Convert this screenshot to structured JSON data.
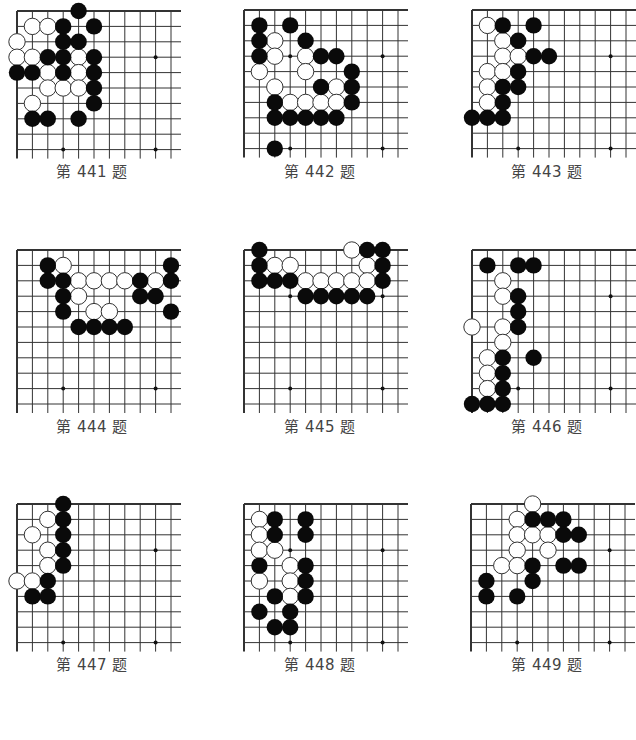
{
  "page": {
    "colors": {
      "line": "#333333",
      "black_stone": "#0a0a0a",
      "white_stone": "#ffffff",
      "stone_outline": "#333333",
      "caption": "#444444"
    },
    "grid_spacing": 15.4,
    "stone_radius": 8.2
  },
  "problems": [
    {
      "caption": "第 441 题",
      "number": 441,
      "origin": [
        17,
        11
      ],
      "cols": 11,
      "rows": 10,
      "caption_xy": [
        12,
        160
      ],
      "star_points": [
        [
          3,
          3
        ],
        [
          9,
          3
        ],
        [
          3,
          9
        ],
        [
          9,
          9
        ]
      ],
      "black": [
        [
          4,
          0
        ],
        [
          3,
          1
        ],
        [
          5,
          1
        ],
        [
          3,
          2
        ],
        [
          4,
          2
        ],
        [
          2,
          3
        ],
        [
          3,
          3
        ],
        [
          5,
          3
        ],
        [
          0,
          4
        ],
        [
          1,
          4
        ],
        [
          3,
          4
        ],
        [
          5,
          4
        ],
        [
          5,
          5
        ],
        [
          5,
          6
        ],
        [
          1,
          7
        ],
        [
          2,
          7
        ],
        [
          4,
          7
        ]
      ],
      "white": [
        [
          1,
          1
        ],
        [
          2,
          1
        ],
        [
          0,
          2
        ],
        [
          0,
          3
        ],
        [
          1,
          3
        ],
        [
          4,
          3
        ],
        [
          2,
          4
        ],
        [
          4,
          4
        ],
        [
          2,
          5
        ],
        [
          3,
          5
        ],
        [
          4,
          5
        ],
        [
          1,
          6
        ]
      ]
    },
    {
      "caption": "第 442 题",
      "number": 442,
      "origin": [
        244,
        10
      ],
      "cols": 11,
      "rows": 10,
      "caption_xy": [
        240,
        160
      ],
      "star_points": [
        [
          3,
          3
        ],
        [
          9,
          3
        ],
        [
          3,
          9
        ],
        [
          9,
          9
        ]
      ],
      "black": [
        [
          1,
          1
        ],
        [
          3,
          1
        ],
        [
          1,
          2
        ],
        [
          4,
          2
        ],
        [
          1,
          3
        ],
        [
          5,
          3
        ],
        [
          6,
          3
        ],
        [
          7,
          4
        ],
        [
          5,
          5
        ],
        [
          7,
          5
        ],
        [
          2,
          6
        ],
        [
          7,
          6
        ],
        [
          2,
          7
        ],
        [
          3,
          7
        ],
        [
          4,
          7
        ],
        [
          5,
          7
        ],
        [
          6,
          7
        ],
        [
          2,
          9
        ]
      ],
      "white": [
        [
          2,
          2
        ],
        [
          2,
          3
        ],
        [
          4,
          3
        ],
        [
          1,
          4
        ],
        [
          4,
          4
        ],
        [
          2,
          5
        ],
        [
          6,
          5
        ],
        [
          3,
          6
        ],
        [
          4,
          6
        ],
        [
          5,
          6
        ],
        [
          6,
          6
        ]
      ]
    },
    {
      "caption": "第 443 题",
      "number": 443,
      "origin": [
        472,
        10
      ],
      "cols": 11,
      "rows": 10,
      "caption_xy": [
        467,
        160
      ],
      "star_points": [
        [
          3,
          3
        ],
        [
          9,
          3
        ],
        [
          3,
          9
        ],
        [
          9,
          9
        ]
      ],
      "black": [
        [
          2,
          1
        ],
        [
          4,
          1
        ],
        [
          3,
          2
        ],
        [
          4,
          3
        ],
        [
          5,
          3
        ],
        [
          3,
          4
        ],
        [
          2,
          5
        ],
        [
          3,
          5
        ],
        [
          2,
          6
        ],
        [
          0,
          7
        ],
        [
          1,
          7
        ],
        [
          2,
          7
        ]
      ],
      "white": [
        [
          1,
          1
        ],
        [
          2,
          2
        ],
        [
          2,
          3
        ],
        [
          3,
          3
        ],
        [
          1,
          4
        ],
        [
          2,
          4
        ],
        [
          1,
          5
        ],
        [
          1,
          6
        ]
      ]
    },
    {
      "caption": "第 444 题",
      "number": 444,
      "origin": [
        17,
        250
      ],
      "cols": 11,
      "rows": 11,
      "caption_xy": [
        12,
        415
      ],
      "star_points": [
        [
          3,
          3
        ],
        [
          9,
          3
        ],
        [
          3,
          9
        ],
        [
          9,
          9
        ]
      ],
      "black": [
        [
          2,
          1
        ],
        [
          10,
          1
        ],
        [
          2,
          2
        ],
        [
          3,
          2
        ],
        [
          8,
          2
        ],
        [
          10,
          2
        ],
        [
          3,
          3
        ],
        [
          8,
          3
        ],
        [
          9,
          3
        ],
        [
          3,
          4
        ],
        [
          10,
          4
        ],
        [
          4,
          5
        ],
        [
          5,
          5
        ],
        [
          6,
          5
        ],
        [
          7,
          5
        ]
      ],
      "white": [
        [
          3,
          1
        ],
        [
          4,
          2
        ],
        [
          5,
          2
        ],
        [
          6,
          2
        ],
        [
          7,
          2
        ],
        [
          9,
          2
        ],
        [
          4,
          3
        ],
        [
          5,
          4
        ],
        [
          6,
          4
        ]
      ]
    },
    {
      "caption": "第 445 题",
      "number": 445,
      "origin": [
        244,
        250
      ],
      "cols": 11,
      "rows": 11,
      "caption_xy": [
        240,
        415
      ],
      "star_points": [
        [
          3,
          3
        ],
        [
          9,
          3
        ],
        [
          3,
          9
        ],
        [
          9,
          9
        ]
      ],
      "black": [
        [
          1,
          0
        ],
        [
          8,
          0
        ],
        [
          9,
          0
        ],
        [
          1,
          1
        ],
        [
          9,
          1
        ],
        [
          1,
          2
        ],
        [
          2,
          2
        ],
        [
          3,
          2
        ],
        [
          9,
          2
        ],
        [
          4,
          3
        ],
        [
          5,
          3
        ],
        [
          6,
          3
        ],
        [
          7,
          3
        ],
        [
          8,
          3
        ]
      ],
      "white": [
        [
          7,
          0
        ],
        [
          2,
          1
        ],
        [
          3,
          1
        ],
        [
          8,
          1
        ],
        [
          4,
          2
        ],
        [
          5,
          2
        ],
        [
          6,
          2
        ],
        [
          7,
          2
        ],
        [
          8,
          2
        ]
      ]
    },
    {
      "caption": "第 446 题",
      "number": 446,
      "origin": [
        472,
        250
      ],
      "cols": 11,
      "rows": 11,
      "caption_xy": [
        467,
        415
      ],
      "star_points": [
        [
          3,
          3
        ],
        [
          9,
          3
        ],
        [
          3,
          9
        ],
        [
          9,
          9
        ]
      ],
      "black": [
        [
          1,
          1
        ],
        [
          3,
          1
        ],
        [
          4,
          1
        ],
        [
          3,
          3
        ],
        [
          3,
          4
        ],
        [
          3,
          5
        ],
        [
          2,
          7
        ],
        [
          4,
          7
        ],
        [
          2,
          8
        ],
        [
          2,
          9
        ],
        [
          0,
          10
        ],
        [
          1,
          10
        ],
        [
          2,
          10
        ]
      ],
      "white": [
        [
          2,
          2
        ],
        [
          2,
          3
        ],
        [
          0,
          5
        ],
        [
          2,
          5
        ],
        [
          2,
          6
        ],
        [
          1,
          7
        ],
        [
          1,
          8
        ],
        [
          1,
          9
        ]
      ]
    },
    {
      "caption": "第 447 题",
      "number": 447,
      "origin": [
        17,
        504
      ],
      "cols": 11,
      "rows": 10,
      "caption_xy": [
        12,
        653
      ],
      "star_points": [
        [
          3,
          3
        ],
        [
          9,
          3
        ],
        [
          3,
          9
        ],
        [
          9,
          9
        ]
      ],
      "black": [
        [
          3,
          0
        ],
        [
          3,
          1
        ],
        [
          3,
          2
        ],
        [
          3,
          3
        ],
        [
          3,
          4
        ],
        [
          2,
          5
        ],
        [
          1,
          6
        ],
        [
          2,
          6
        ]
      ],
      "white": [
        [
          2,
          1
        ],
        [
          1,
          2
        ],
        [
          2,
          3
        ],
        [
          2,
          4
        ],
        [
          0,
          5
        ],
        [
          1,
          5
        ]
      ]
    },
    {
      "caption": "第 448 题",
      "number": 448,
      "origin": [
        244,
        504
      ],
      "cols": 11,
      "rows": 10,
      "caption_xy": [
        240,
        653
      ],
      "star_points": [
        [
          3,
          3
        ],
        [
          9,
          3
        ],
        [
          3,
          9
        ],
        [
          9,
          9
        ]
      ],
      "black": [
        [
          2,
          1
        ],
        [
          4,
          1
        ],
        [
          2,
          2
        ],
        [
          4,
          2
        ],
        [
          1,
          4
        ],
        [
          4,
          4
        ],
        [
          4,
          5
        ],
        [
          2,
          6
        ],
        [
          4,
          6
        ],
        [
          1,
          7
        ],
        [
          3,
          7
        ],
        [
          2,
          8
        ],
        [
          3,
          8
        ]
      ],
      "white": [
        [
          1,
          1
        ],
        [
          1,
          2
        ],
        [
          1,
          3
        ],
        [
          2,
          3
        ],
        [
          3,
          4
        ],
        [
          1,
          5
        ],
        [
          3,
          5
        ],
        [
          3,
          6
        ]
      ]
    },
    {
      "caption": "第 449 题",
      "number": 449,
      "origin": [
        471,
        504
      ],
      "cols": 11,
      "rows": 10,
      "caption_xy": [
        467,
        653
      ],
      "star_points": [
        [
          3,
          3
        ],
        [
          9,
          3
        ],
        [
          3,
          9
        ],
        [
          9,
          9
        ]
      ],
      "black": [
        [
          4,
          1
        ],
        [
          5,
          1
        ],
        [
          6,
          1
        ],
        [
          6,
          2
        ],
        [
          7,
          2
        ],
        [
          4,
          4
        ],
        [
          6,
          4
        ],
        [
          7,
          4
        ],
        [
          1,
          5
        ],
        [
          4,
          5
        ],
        [
          1,
          6
        ],
        [
          3,
          6
        ]
      ],
      "white": [
        [
          4,
          0
        ],
        [
          3,
          1
        ],
        [
          3,
          2
        ],
        [
          4,
          2
        ],
        [
          5,
          2
        ],
        [
          3,
          3
        ],
        [
          5,
          3
        ],
        [
          2,
          4
        ],
        [
          3,
          4
        ]
      ]
    }
  ]
}
